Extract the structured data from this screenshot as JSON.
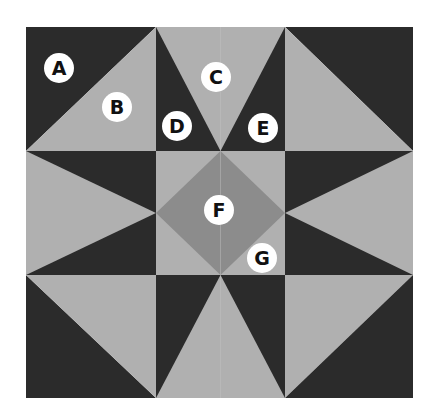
{
  "diagram": {
    "type": "quilt-block-pattern",
    "grid": {
      "x": [
        26,
        156,
        285,
        413
      ],
      "y": [
        27,
        151,
        275,
        398
      ]
    },
    "colors": {
      "dark": "#2b2b2b",
      "light": "#b0b0b0",
      "medium": "#8c8c8c",
      "label_bg": "#ffffff",
      "label_text": "#111111",
      "seam": "#c4c4c4"
    },
    "labels": [
      {
        "id": "A",
        "text": "A",
        "x": 59,
        "y": 68,
        "region": "dark corner triangle (top-left block)"
      },
      {
        "id": "B",
        "text": "B",
        "x": 117,
        "y": 107,
        "region": "light corner triangle (top-left block)"
      },
      {
        "id": "C",
        "text": "C",
        "x": 216,
        "y": 77,
        "region": "light center triangle (top-middle block)"
      },
      {
        "id": "D",
        "text": "D",
        "x": 177,
        "y": 126,
        "region": "dark left side triangle (top-middle block)"
      },
      {
        "id": "E",
        "text": "E",
        "x": 263,
        "y": 128,
        "region": "dark right side triangle (top-middle block)"
      },
      {
        "id": "F",
        "text": "F",
        "x": 219,
        "y": 210,
        "region": "medium center diamond"
      },
      {
        "id": "G",
        "text": "G",
        "x": 262,
        "y": 258,
        "region": "light corner triangle (center block)"
      }
    ]
  }
}
